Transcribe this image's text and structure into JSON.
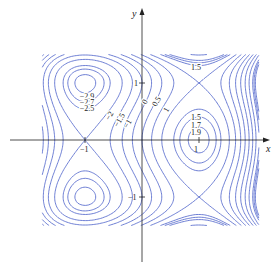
{
  "chart_data": {
    "type": "contour",
    "title": "",
    "function": "f(x,y) = 3x - x^3 - 2y^2 + y^4",
    "xlabel": "x",
    "ylabel": "y",
    "xlim": [
      -2.05,
      2.05
    ],
    "ylim": [
      -1.55,
      1.55
    ],
    "x_ticks": [
      {
        "value": -1,
        "label": "-1"
      },
      {
        "value": 1,
        "label": "1"
      }
    ],
    "y_ticks": [
      {
        "value": 1,
        "label": "1"
      },
      {
        "value": -1,
        "label": "-1"
      }
    ],
    "contour_levels": [
      -2.9,
      -2.7,
      -2.5,
      -2,
      -1.5,
      -1,
      -0.5,
      0,
      0.5,
      1,
      1.5,
      1.7,
      1.9,
      2.5,
      3,
      3.5,
      4,
      4.5,
      5
    ],
    "labels": [
      {
        "text": "-2.9",
        "x": -0.95,
        "y": 0.78
      },
      {
        "text": "-2.7",
        "x": -0.95,
        "y": 0.67
      },
      {
        "text": "-2.5",
        "x": -0.95,
        "y": 0.56
      },
      {
        "text": "-2",
        "x": -0.52,
        "y": 0.44
      },
      {
        "text": "-1.5",
        "x": -0.37,
        "y": 0.32
      },
      {
        "text": "-1",
        "x": -0.2,
        "y": 0.3
      },
      {
        "text": "0",
        "x": 0.12,
        "y": 0.72
      },
      {
        "text": "0.5",
        "x": 0.3,
        "y": 0.68
      },
      {
        "text": "1",
        "x": 0.5,
        "y": 0.58
      },
      {
        "text": "1.5",
        "x": 1.0,
        "y": 1.28
      },
      {
        "text": "1.5",
        "x": 1.0,
        "y": 0.4
      },
      {
        "text": "1.7",
        "x": 1.0,
        "y": 0.27
      },
      {
        "text": "1.9",
        "x": 1.0,
        "y": 0.14
      }
    ],
    "critical_points": [
      {
        "type": "local max",
        "x": 1,
        "y": 0,
        "value": 2
      },
      {
        "type": "local min",
        "x": -1,
        "y": 1,
        "value": -3
      },
      {
        "type": "local min",
        "x": -1,
        "y": -1,
        "value": -3
      },
      {
        "type": "saddle",
        "x": -1,
        "y": 0,
        "value": -2
      },
      {
        "type": "saddle",
        "x": 1,
        "y": 1,
        "value": 1
      },
      {
        "type": "saddle",
        "x": 1,
        "y": -1,
        "value": 1
      }
    ],
    "grid": false,
    "line_color": "#4a5fc9"
  },
  "axes": {
    "x_label": "x",
    "y_label": "y"
  }
}
